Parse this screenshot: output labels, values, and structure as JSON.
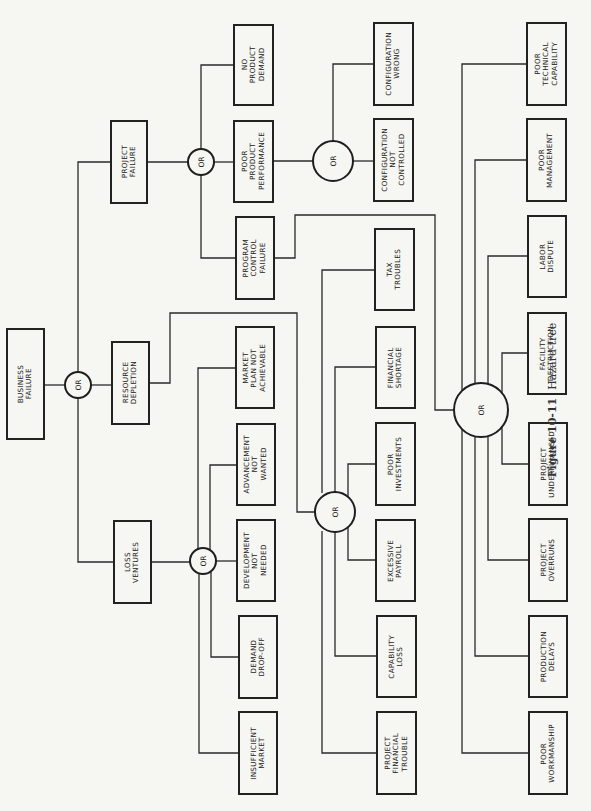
{
  "figure": {
    "number": "Figure 10-11",
    "title": "Hazard tree",
    "orientation": "rotated 90 degrees counter-clockwise"
  },
  "gate_label": "OR",
  "nodes": {
    "business_failure": "BUSINESS\nFAILURE",
    "resource_depletion": "RESOURCE\nDEPLETION",
    "loss_ventures": "LOSS\nVENTURES",
    "project_failure": "PROJECT\nFAILURE",
    "no_product_demand": "NO\nPRODUCT\nDEMAND",
    "poor_product_performance": "POOR\nPRODUCT\nPERFORMANCE",
    "program_control_failure": "PROGRAM\nCONTROL\nFAILURE",
    "configuration_not_controlled": "CONFIGURATION\nNOT\nCONTROLLED",
    "configuration_wrong": "CONFIGURATION\nWRONG",
    "poor_technical_capability": "POOR\nTECHNICAL\nCAPABILITY",
    "poor_management": "POOR\nMANAGEMENT",
    "labor_dispute": "LABOR\nDISPUTE",
    "facility_destruction": "FACILITY\nDESTRUCTION",
    "project_underfinanced": "PROJECT\nUNDERFINANCED",
    "project_overruns": "PROJECT\nOVERRUNS",
    "production_delays": "PRODUCTION\nDELAYS",
    "poor_workmanship": "POOR\nWORKMANSHIP",
    "tax_troubles": "TAX\nTROUBLES",
    "financial_shortage": "FINANCIAL\nSHORTAGE",
    "poor_investments": "POOR\nINVESTMENTS",
    "excessive_payroll": "EXCESSIVE\nPAYROLL",
    "capability_loss": "CAPABILITY\nLOSS",
    "project_financial_trouble": "PROJECT\nFINANCIAL\nTROUBLE",
    "market_plan_not_achievable": "MARKET\nPLAN NOT\nACHIEVABLE",
    "advancement_not_wanted": "ADVANCEMENT\nNOT\nWANTED",
    "development_not_needed": "DEVELOPMENT\nNOT\nNEEDED",
    "demand_drop_off": "DEMAND\nDROP-OFF",
    "insufficient_market": "INSUFFICIENT\nMARKET"
  },
  "tree": {
    "root": "BUSINESS FAILURE",
    "gate": "OR",
    "children": [
      {
        "node": "PROJECT FAILURE",
        "gate": "OR",
        "children": [
          "NO PRODUCT DEMAND",
          {
            "node": "POOR PRODUCT PERFORMANCE",
            "gate": "OR",
            "children": [
              "CONFIGURATION NOT CONTROLLED",
              "CONFIGURATION WRONG"
            ]
          },
          {
            "node": "PROGRAM CONTROL FAILURE",
            "feeds": "large OR gate"
          }
        ]
      },
      {
        "node": "RESOURCE DEPLETION",
        "feeds": "middle OR gate"
      },
      {
        "node": "LOSS VENTURES",
        "gate": "OR",
        "children": [
          "MARKET PLAN NOT ACHIEVABLE",
          "ADVANCEMENT NOT WANTED",
          "DEVELOPMENT NOT NEEDED",
          "DEMAND DROP-OFF",
          "INSUFFICIENT MARKET"
        ]
      }
    ],
    "middle_or_children": [
      "TAX TROUBLES",
      "FINANCIAL SHORTAGE",
      "POOR INVESTMENTS",
      "EXCESSIVE PAYROLL",
      "CAPABILITY LOSS",
      "PROJECT FINANCIAL TROUBLE"
    ],
    "large_or_children": [
      "POOR TECHNICAL CAPABILITY",
      "POOR MANAGEMENT",
      "LABOR DISPUTE",
      "FACILITY DESTRUCTION",
      "PROJECT UNDERFINANCED",
      "PROJECT OVERRUNS",
      "PRODUCTION DELAYS",
      "POOR WORKMANSHIP"
    ]
  }
}
